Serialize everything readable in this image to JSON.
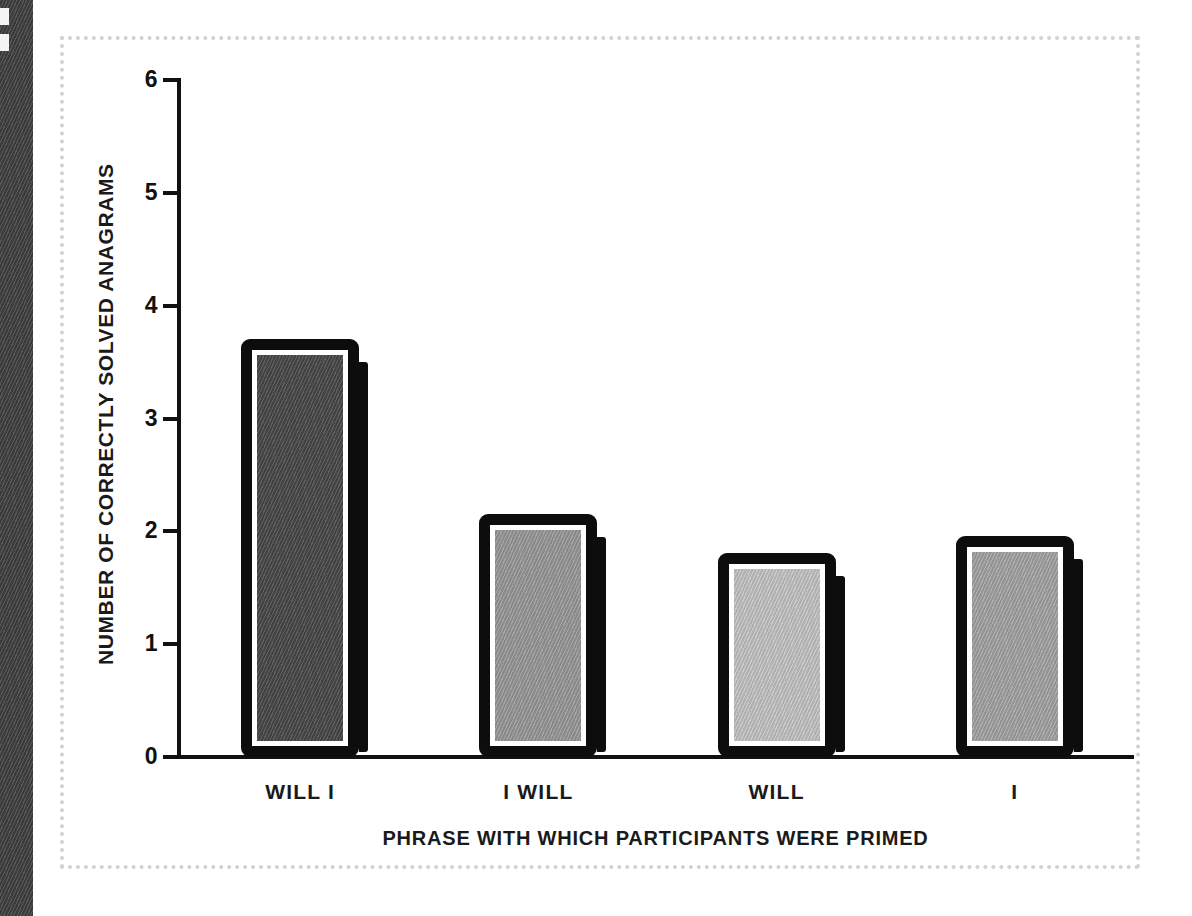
{
  "figure": {
    "frame_style": "dotted-light-gray",
    "frame_color": "#d2d2d2",
    "background_color": "#ffffff"
  },
  "edge_strip": {
    "name": "page-edge-texture",
    "color": "#464646"
  },
  "chart_data": {
    "type": "bar",
    "title": "",
    "xlabel": "PHRASE WITH WHICH PARTICIPANTS WERE PRIMED",
    "ylabel": "NUMBER OF CORRECTLY SOLVED ANAGRAMS",
    "categories": [
      "WILL I",
      "I WILL",
      "WILL",
      "I"
    ],
    "values": [
      3.6,
      2.05,
      1.7,
      1.85
    ],
    "ylim": [
      0,
      6
    ],
    "yticks": [
      0,
      1,
      2,
      3,
      4,
      5,
      6
    ],
    "ytick_labels": [
      "0",
      "1",
      "2",
      "3",
      "4",
      "5",
      "6"
    ],
    "grid": false,
    "legend": "none",
    "bar_fill_colors": [
      "#4a4a4a",
      "#9a9a9a",
      "#c5c5c5",
      "#a5a5a5"
    ],
    "bar_outline_color": "#0d0d0d",
    "axis_color": "#111111"
  }
}
